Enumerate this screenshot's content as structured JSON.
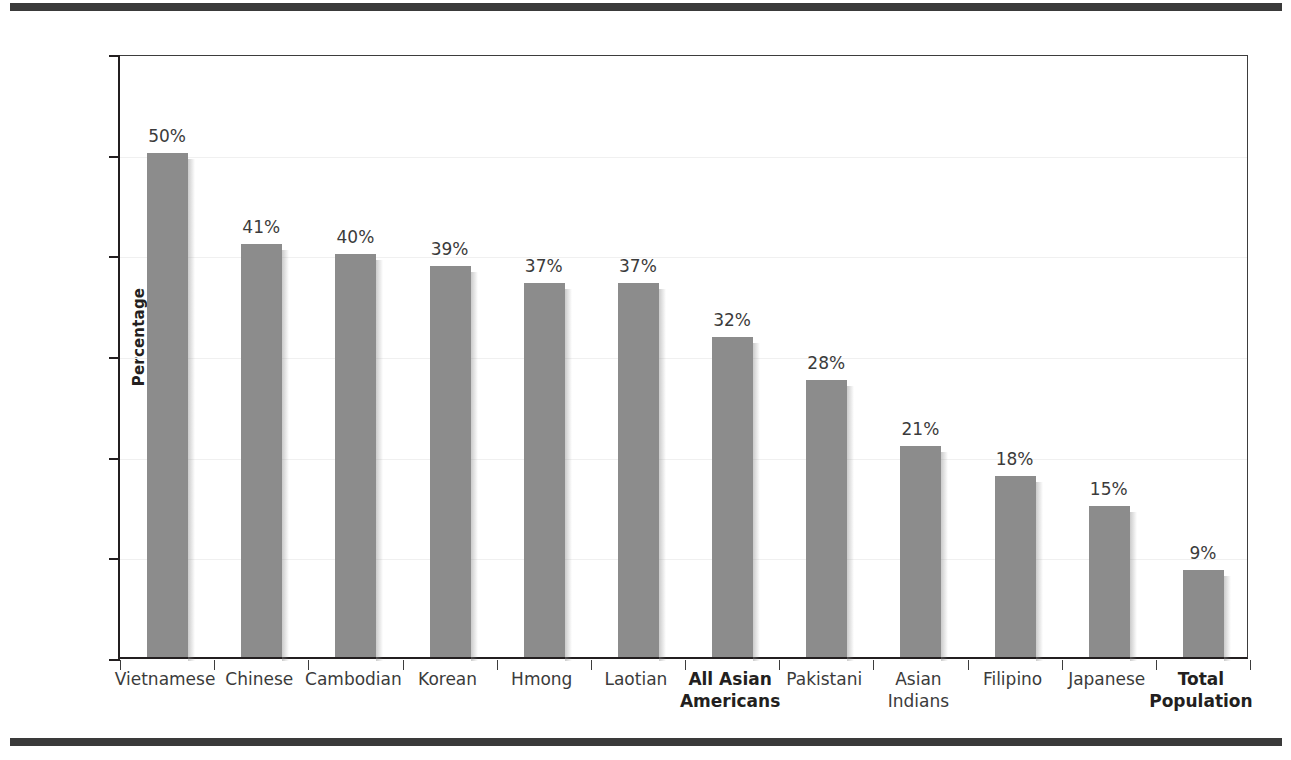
{
  "figure": {
    "top_rule": "horizontal-rule",
    "bottom_rule": "horizontal-rule"
  },
  "chart_data": {
    "type": "bar",
    "title": "",
    "xlabel": "",
    "ylabel": "Percentage",
    "ylim": [
      0,
      60
    ],
    "yticks": [
      0,
      10,
      20,
      30,
      40,
      50,
      60
    ],
    "ytick_labels": [
      "0",
      "10",
      "20",
      "30",
      "40",
      "50",
      "60"
    ],
    "grid": true,
    "legend": "none",
    "bar_color": "#8c8c8c",
    "categories": [
      "Vietnamese",
      "Chinese",
      "Cambodian",
      "Korean",
      "Hmong",
      "Laotian",
      "All Asian Americans",
      "Pakistani",
      "Asian Indians",
      "Filipino",
      "Japanese",
      "Total Population"
    ],
    "category_lines": [
      [
        "Vietnamese"
      ],
      [
        "Chinese"
      ],
      [
        "Cambodian"
      ],
      [
        "Korean"
      ],
      [
        "Hmong"
      ],
      [
        "Laotian"
      ],
      [
        "All Asian",
        "Americans"
      ],
      [
        "Pakistani"
      ],
      [
        "Asian",
        "Indians"
      ],
      [
        "Filipino"
      ],
      [
        "Japanese"
      ],
      [
        "Total",
        "Population"
      ]
    ],
    "category_emphasis": [
      false,
      false,
      false,
      false,
      false,
      false,
      true,
      false,
      false,
      false,
      false,
      true
    ],
    "values": [
      50.1,
      41.0,
      40.0,
      38.8,
      37.2,
      37.2,
      31.8,
      27.5,
      21.0,
      18.0,
      15.0,
      8.6
    ],
    "data_labels": [
      "50%",
      "41%",
      "40%",
      "39%",
      "37%",
      "37%",
      "32%",
      "28%",
      "21%",
      "18%",
      "15%",
      "9%"
    ]
  }
}
